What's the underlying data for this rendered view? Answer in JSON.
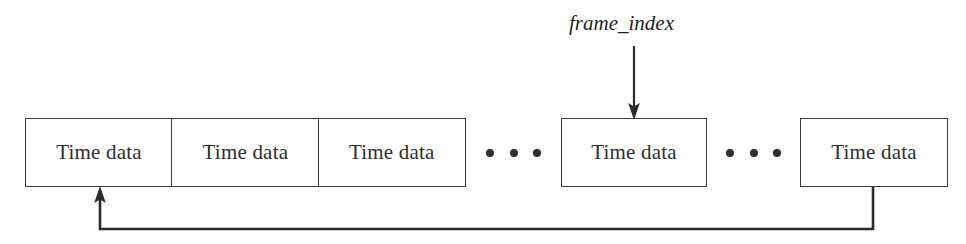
{
  "diagram": {
    "background_color": "#ffffff",
    "line_color": "#3a3a3a",
    "text_color": "#2e2e2e",
    "pointer_label": "frame_index",
    "frames": [
      {
        "label": "Time data"
      },
      {
        "label": "Time data"
      },
      {
        "label": "Time data"
      },
      {
        "label": "Time data"
      },
      {
        "label": "Time data"
      }
    ],
    "ellipses": [
      {
        "dots": "• • •"
      },
      {
        "dots": "• • •"
      }
    ],
    "annotations": {
      "pointer_arrow": "down-arrow-icon",
      "wrap_arrow": "up-arrow-icon",
      "feedback_path": "wrap-around-connector"
    }
  }
}
